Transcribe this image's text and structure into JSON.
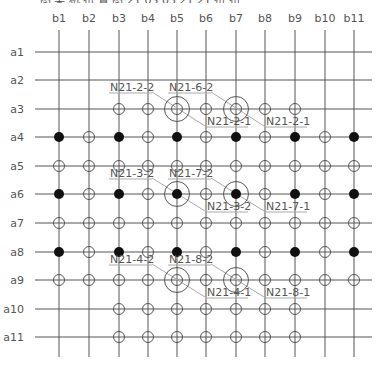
{
  "title_cropped": "图 某 机 布 置 图 21 05 03 21 21 布 布",
  "colors": {
    "grid_line": "#555555",
    "marker_stroke": "#555555",
    "filled_marker": "#111111",
    "leader_line": "#aaaaaa",
    "label_text": "#555555"
  },
  "columns": [
    {
      "label": "b1",
      "x": 59
    },
    {
      "label": "b2",
      "x": 89
    },
    {
      "label": "b3",
      "x": 119
    },
    {
      "label": "b4",
      "x": 148
    },
    {
      "label": "b5",
      "x": 177
    },
    {
      "label": "b6",
      "x": 206
    },
    {
      "label": "b7",
      "x": 236
    },
    {
      "label": "b8",
      "x": 265
    },
    {
      "label": "b9",
      "x": 295
    },
    {
      "label": "b10",
      "x": 325
    },
    {
      "label": "b11",
      "x": 354
    }
  ],
  "rows": [
    {
      "label": "a1",
      "y": 52
    },
    {
      "label": "a2",
      "y": 80
    },
    {
      "label": "a3",
      "y": 109
    },
    {
      "label": "a4",
      "y": 137
    },
    {
      "label": "a5",
      "y": 166
    },
    {
      "label": "a6",
      "y": 194
    },
    {
      "label": "a7",
      "y": 223
    },
    {
      "label": "a8",
      "y": 252
    },
    {
      "label": "a9",
      "y": 280
    },
    {
      "label": "a10",
      "y": 309
    },
    {
      "label": "a11",
      "y": 337
    }
  ],
  "markers": {
    "a3": {
      "open": [
        "b3",
        "b4",
        "b6",
        "b8",
        "b9"
      ],
      "filled": [],
      "large_open": [
        "b5",
        "b7"
      ],
      "large_filled": []
    },
    "a4": {
      "open": [
        "b2",
        "b4",
        "b6",
        "b8",
        "b10"
      ],
      "filled": [
        "b1",
        "b3",
        "b5",
        "b7",
        "b9",
        "b11"
      ],
      "large_open": [],
      "large_filled": []
    },
    "a5": {
      "open": [
        "b1",
        "b2",
        "b3",
        "b4",
        "b5",
        "b6",
        "b7",
        "b8",
        "b9",
        "b10",
        "b11"
      ],
      "filled": [],
      "large_open": [],
      "large_filled": []
    },
    "a6": {
      "open": [
        "b2",
        "b4",
        "b6",
        "b8",
        "b10"
      ],
      "filled": [
        "b1",
        "b3",
        "b9",
        "b11"
      ],
      "large_open": [],
      "large_filled": [
        "b5",
        "b7"
      ]
    },
    "a7": {
      "open": [
        "b1",
        "b2",
        "b3",
        "b4",
        "b5",
        "b6",
        "b7",
        "b8",
        "b9",
        "b10",
        "b11"
      ],
      "filled": [],
      "large_open": [],
      "large_filled": []
    },
    "a8": {
      "open": [
        "b2",
        "b4",
        "b6",
        "b8",
        "b10"
      ],
      "filled": [
        "b1",
        "b3",
        "b5",
        "b7",
        "b9",
        "b11"
      ],
      "large_open": [],
      "large_filled": []
    },
    "a9": {
      "open": [
        "b1",
        "b2",
        "b3",
        "b4",
        "b6",
        "b8",
        "b9",
        "b10",
        "b11"
      ],
      "filled": [],
      "large_open": [
        "b5",
        "b7"
      ],
      "large_filled": []
    },
    "a10": {
      "open": [
        "b3",
        "b4",
        "b5",
        "b6",
        "b7",
        "b8",
        "b9"
      ],
      "filled": [],
      "large_open": [],
      "large_filled": []
    },
    "a11": {
      "open": [
        "b3",
        "b4",
        "b5",
        "b6",
        "b7",
        "b8",
        "b9"
      ],
      "filled": [],
      "large_open": [],
      "large_filled": []
    }
  },
  "callouts": [
    {
      "text": "N21-2-2",
      "x": 110,
      "y": 91,
      "ul": [
        109,
        152
      ],
      "leader": [
        [
          152,
          92
        ],
        [
          205,
          126
        ]
      ]
    },
    {
      "text": "N21-6-2",
      "x": 169,
      "y": 91,
      "ul": [
        168,
        211
      ],
      "leader": [
        [
          211,
          92
        ],
        [
          264,
          126
        ]
      ]
    },
    {
      "text": "N21-2-1",
      "x": 207,
      "y": 125,
      "ul": [
        205,
        248
      ],
      "leader": null
    },
    {
      "text": "N21-2-1",
      "x": 266,
      "y": 125,
      "ul": [
        264,
        307
      ],
      "leader": null
    },
    {
      "text": "N21-3-2",
      "x": 110,
      "y": 177,
      "ul": [
        109,
        152
      ],
      "leader": [
        [
          152,
          178
        ],
        [
          205,
          211
        ]
      ]
    },
    {
      "text": "N21-7-2",
      "x": 169,
      "y": 177,
      "ul": [
        168,
        211
      ],
      "leader": [
        [
          211,
          178
        ],
        [
          264,
          211
        ]
      ]
    },
    {
      "text": "N21-3-2",
      "x": 207,
      "y": 210,
      "ul": [
        205,
        248
      ],
      "leader": null
    },
    {
      "text": "N21-7-1",
      "x": 266,
      "y": 210,
      "ul": [
        264,
        307
      ],
      "leader": null
    },
    {
      "text": "N21-4-2",
      "x": 110,
      "y": 263,
      "ul": [
        109,
        152
      ],
      "leader": [
        [
          152,
          264
        ],
        [
          205,
          297
        ]
      ]
    },
    {
      "text": "N21-8-2",
      "x": 169,
      "y": 263,
      "ul": [
        168,
        211
      ],
      "leader": [
        [
          211,
          264
        ],
        [
          264,
          297
        ]
      ]
    },
    {
      "text": "N21-4-1",
      "x": 207,
      "y": 296,
      "ul": [
        205,
        248
      ],
      "leader": null
    },
    {
      "text": "N21-8-1",
      "x": 266,
      "y": 296,
      "ul": [
        264,
        307
      ],
      "leader": null
    }
  ],
  "grid_extent": {
    "h_x1": 35,
    "h_x2": 372,
    "v_y1": 30,
    "v_y2": 357
  }
}
